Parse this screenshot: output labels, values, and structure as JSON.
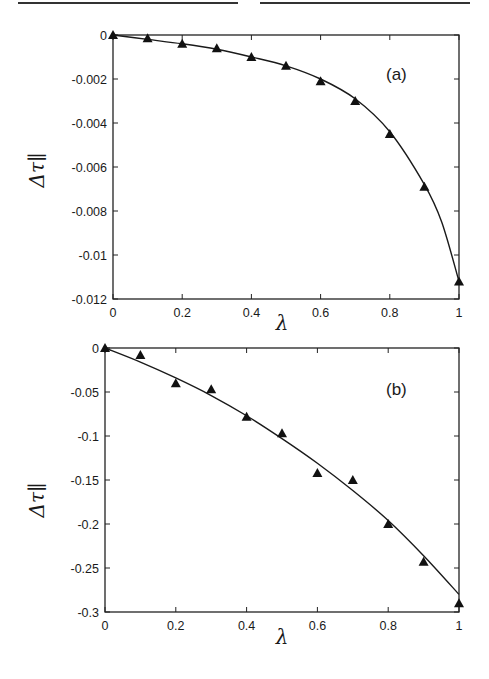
{
  "chart_data": [
    {
      "type": "line",
      "panel_label": "(a)",
      "title": "",
      "xlabel": "λ",
      "ylabel": "Δτ∥",
      "xlim": [
        0,
        1
      ],
      "ylim": [
        -0.012,
        0
      ],
      "grid": false,
      "x_ticks": [
        "0",
        "0.2",
        "0.4",
        "0.6",
        "0.8",
        "1"
      ],
      "y_ticks": [
        "0",
        "-0.002",
        "-0.004",
        "-0.006",
        "-0.008",
        "-0.01",
        "-0.012"
      ],
      "series": [
        {
          "name": "data points",
          "marker": "filled-triangle",
          "x": [
            0,
            0.1,
            0.2,
            0.3,
            0.4,
            0.5,
            0.6,
            0.7,
            0.8,
            0.9,
            1.0
          ],
          "values": [
            0,
            -0.00015,
            -0.0004,
            -0.0006,
            -0.001,
            -0.0014,
            -0.0021,
            -0.003,
            -0.0045,
            -0.0069,
            -0.0112
          ]
        },
        {
          "name": "fit curve",
          "style": "solid-line",
          "x": [
            0,
            0.1,
            0.2,
            0.3,
            0.4,
            0.5,
            0.6,
            0.7,
            0.8,
            0.9,
            0.95,
            1.0
          ],
          "values": [
            0,
            -0.0002,
            -0.0004,
            -0.00065,
            -0.001,
            -0.0014,
            -0.002,
            -0.0029,
            -0.0044,
            -0.0068,
            -0.0085,
            -0.0112
          ]
        }
      ]
    },
    {
      "type": "line",
      "panel_label": "(b)",
      "title": "",
      "xlabel": "λ",
      "ylabel": "Δτ∥",
      "xlim": [
        0,
        1
      ],
      "ylim": [
        -0.3,
        0
      ],
      "grid": false,
      "x_ticks": [
        "0",
        "0.2",
        "0.4",
        "0.6",
        "0.8",
        "1"
      ],
      "y_ticks": [
        "0",
        "-0.05",
        "-0.1",
        "-0.15",
        "-0.2",
        "-0.25",
        "-0.3"
      ],
      "series": [
        {
          "name": "data points",
          "marker": "filled-triangle",
          "x": [
            0,
            0.1,
            0.2,
            0.3,
            0.4,
            0.5,
            0.6,
            0.7,
            0.8,
            0.9,
            1.0
          ],
          "values": [
            0,
            -0.008,
            -0.04,
            -0.047,
            -0.078,
            -0.097,
            -0.142,
            -0.15,
            -0.2,
            -0.243,
            -0.29
          ]
        },
        {
          "name": "fit curve",
          "style": "solid-line",
          "x": [
            0,
            0.1,
            0.2,
            0.3,
            0.4,
            0.5,
            0.6,
            0.7,
            0.8,
            0.9,
            1.0
          ],
          "values": [
            0,
            -0.016,
            -0.034,
            -0.054,
            -0.077,
            -0.103,
            -0.131,
            -0.162,
            -0.196,
            -0.236,
            -0.28
          ]
        }
      ]
    }
  ]
}
